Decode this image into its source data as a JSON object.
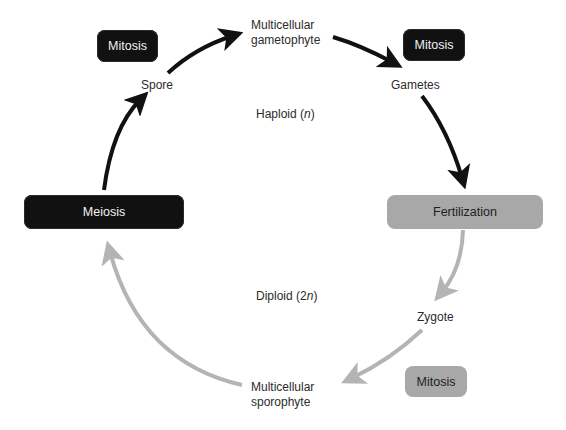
{
  "diagram": {
    "type": "life-cycle",
    "title": "",
    "colors": {
      "haploid_arrow": "#111111",
      "diploid_arrow": "#b4b4b4",
      "dark_box": "#111111",
      "light_box": "#a8a8a8"
    },
    "nodes": {
      "gametophyte_line1": "Multicellular",
      "gametophyte_line2": "gametophyte",
      "gametes": "Gametes",
      "zygote": "Zygote",
      "sporophyte_line1": "Multicellular",
      "sporophyte_line2": "sporophyte",
      "spore": "Spore"
    },
    "processes": {
      "mitosis_top_left": "Mitosis",
      "mitosis_top_right": "Mitosis",
      "fertilization": "Fertilization",
      "mitosis_bottom_right": "Mitosis",
      "meiosis": "Meiosis"
    },
    "phases": {
      "haploid_prefix": "Haploid (",
      "haploid_symbol": "n",
      "haploid_suffix": ")",
      "diploid_prefix": "Diploid (2",
      "diploid_symbol": "n",
      "diploid_suffix": ")"
    },
    "edges": [
      {
        "from": "Spore",
        "to": "Multicellular gametophyte",
        "phase": "haploid"
      },
      {
        "from": "Multicellular gametophyte",
        "to": "Gametes",
        "phase": "haploid"
      },
      {
        "from": "Gametes",
        "to": "Fertilization",
        "phase": "haploid"
      },
      {
        "from": "Fertilization",
        "to": "Zygote",
        "phase": "diploid"
      },
      {
        "from": "Zygote",
        "to": "Multicellular sporophyte",
        "phase": "diploid"
      },
      {
        "from": "Multicellular sporophyte",
        "to": "Meiosis",
        "phase": "diploid"
      },
      {
        "from": "Meiosis",
        "to": "Spore",
        "phase": "haploid"
      }
    ]
  }
}
